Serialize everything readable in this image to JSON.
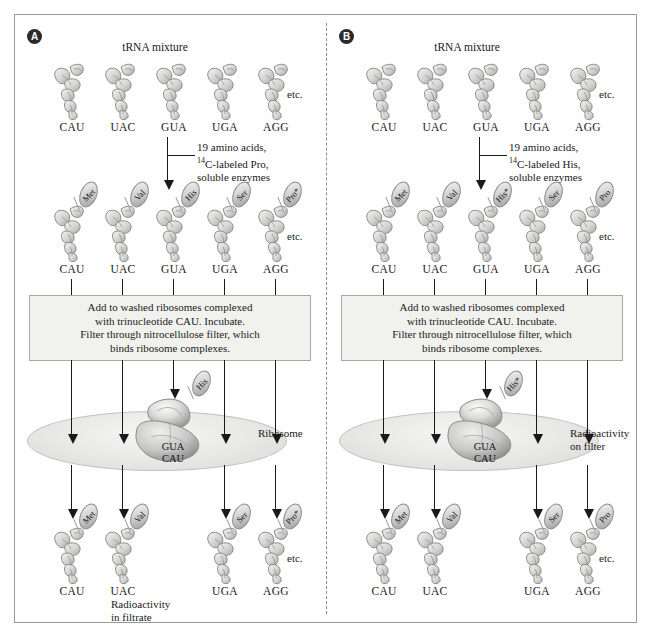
{
  "figure": {
    "etc_label": "etc.",
    "panels": [
      {
        "id": "A",
        "badge": "A",
        "top_label": "tRNA mixture",
        "reagents": {
          "line1": "19 amino acids,",
          "line2_pre": "14",
          "line2_post": "C-labeled Pro,",
          "line3": "soluble enzymes"
        },
        "instruction": {
          "line1": "Add to washed ribosomes complexed",
          "line2": "with trinucleotide CAU. Incubate.",
          "line3": "Filter through nitrocellulose filter, which",
          "line4": "binds ribosome complexes."
        },
        "ribosome": {
          "anticodon": "GUA",
          "codon": "CAU",
          "bound_aa": "His"
        },
        "disc_label": {
          "line1": "Ribosome",
          "line2": ""
        },
        "result_label": {
          "line1": "Radioactivity",
          "line2": "in filtrate"
        },
        "row_uncharged": [
          {
            "anticodon": "CAU"
          },
          {
            "anticodon": "UAC"
          },
          {
            "anticodon": "GUA"
          },
          {
            "anticodon": "UGA"
          },
          {
            "anticodon": "AGG"
          }
        ],
        "row_charged": [
          {
            "anticodon": "CAU",
            "aa": "Met"
          },
          {
            "anticodon": "UAC",
            "aa": "Val"
          },
          {
            "anticodon": "GUA",
            "aa": "His"
          },
          {
            "anticodon": "UGA",
            "aa": "Ser"
          },
          {
            "anticodon": "AGG",
            "aa": "Pro*"
          }
        ],
        "row_filtrate": [
          {
            "anticodon": "CAU",
            "aa": "Met"
          },
          {
            "anticodon": "UAC",
            "aa": "Val"
          },
          {
            "anticodon": "UGA",
            "aa": "Ser"
          },
          {
            "anticodon": "AGG",
            "aa": "Pro*"
          }
        ]
      },
      {
        "id": "B",
        "badge": "B",
        "top_label": "tRNA mixture",
        "reagents": {
          "line1": "19 amino acids,",
          "line2_pre": "14",
          "line2_post": "C-labeled His,",
          "line3": "soluble enzymes"
        },
        "instruction": {
          "line1": "Add to washed ribosomes complexed",
          "line2": "with trinucleotide CAU. Incubate.",
          "line3": "Filter through nitrocellulose filter, which",
          "line4": "binds ribosome complexes."
        },
        "ribosome": {
          "anticodon": "GUA",
          "codon": "CAU",
          "bound_aa": "His*"
        },
        "disc_label": {
          "line1": "Radioactivity",
          "line2": "on filter"
        },
        "result_label": {
          "line1": "",
          "line2": ""
        },
        "row_uncharged": [
          {
            "anticodon": "CAU"
          },
          {
            "anticodon": "UAC"
          },
          {
            "anticodon": "GUA"
          },
          {
            "anticodon": "UGA"
          },
          {
            "anticodon": "AGG"
          }
        ],
        "row_charged": [
          {
            "anticodon": "CAU",
            "aa": "Met"
          },
          {
            "anticodon": "UAC",
            "aa": "Val"
          },
          {
            "anticodon": "GUA",
            "aa": "His*"
          },
          {
            "anticodon": "UGA",
            "aa": "Ser"
          },
          {
            "anticodon": "AGG",
            "aa": "Pro"
          }
        ],
        "row_filtrate": [
          {
            "anticodon": "CAU",
            "aa": "Met"
          },
          {
            "anticodon": "UAC",
            "aa": "Val"
          },
          {
            "anticodon": "UGA",
            "aa": "Ser"
          },
          {
            "anticodon": "AGG",
            "aa": "Pro"
          }
        ]
      }
    ]
  },
  "colors": {
    "frame": "#9a9a9a",
    "ink": "#1a1a1a",
    "box_fill": "#f1f1ee",
    "glyph_mid": "#c9c9c7",
    "badge": "#2b2b2b"
  }
}
